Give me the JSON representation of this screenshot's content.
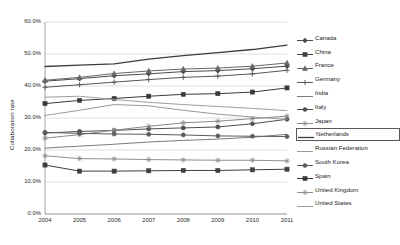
{
  "chart_data": {
    "type": "line",
    "title": "",
    "xlabel": "",
    "ylabel": "Collaboration rate",
    "categories": [
      "2004",
      "2005",
      "2006",
      "2007",
      "2008",
      "2009",
      "2010",
      "2011"
    ],
    "x": [
      2004,
      2005,
      2006,
      2007,
      2008,
      2009,
      2010,
      2011
    ],
    "ylim": [
      0,
      60
    ],
    "ytick_labels": [
      "0.0%",
      "10.0%",
      "20.0%",
      "30.0%",
      "40.0%",
      "50.0%",
      "60.0%"
    ],
    "ytick_values": [
      0,
      10,
      20,
      30,
      40,
      50,
      60
    ],
    "grid": true,
    "grid_axis": "y",
    "legend_position": "right",
    "highlighted_series": "Netherlands",
    "series": [
      {
        "name": "Canada",
        "marker": "diamond",
        "color": "#4a4a4a",
        "values": [
          41.5,
          42.3,
          43.2,
          43.8,
          44.5,
          44.8,
          45.4,
          46.2
        ]
      },
      {
        "name": "China",
        "marker": "square",
        "color": "#3f3f3f",
        "values": [
          15.3,
          13.4,
          13.4,
          13.5,
          13.6,
          13.6,
          13.8,
          14.0
        ]
      },
      {
        "name": "France",
        "marker": "triangle",
        "color": "#666666",
        "values": [
          41.8,
          42.7,
          43.9,
          44.7,
          45.3,
          45.6,
          46.2,
          47.2
        ]
      },
      {
        "name": "Germany",
        "marker": "cross",
        "color": "#555555",
        "values": [
          39.6,
          40.4,
          41.2,
          42.0,
          42.7,
          43.1,
          43.8,
          44.9
        ]
      },
      {
        "name": "India",
        "marker": "none",
        "color": "#7a7a7a",
        "values": [
          20.6,
          21.2,
          21.8,
          22.5,
          23.0,
          23.4,
          24.0,
          24.9
        ]
      },
      {
        "name": "Italy",
        "marker": "circle",
        "color": "#4f4f4f",
        "values": [
          25.3,
          25.8,
          26.1,
          26.6,
          26.9,
          27.2,
          28.2,
          29.6
        ]
      },
      {
        "name": "Japan",
        "marker": "asterisk",
        "color": "#8a8a8a",
        "values": [
          23.7,
          24.8,
          26.2,
          27.4,
          28.5,
          29.0,
          29.8,
          30.6
        ]
      },
      {
        "name": "Netherlands",
        "marker": "none",
        "color": "#3c3c3c",
        "values": [
          46.1,
          46.5,
          46.9,
          48.4,
          49.5,
          50.4,
          51.4,
          52.8
        ]
      },
      {
        "name": "Russian Federation",
        "marker": "none",
        "color": "#9a9a9a",
        "values": [
          30.8,
          32.4,
          34.2,
          33.8,
          32.4,
          31.2,
          30.3,
          29.6
        ]
      },
      {
        "name": "South Korea",
        "marker": "circle",
        "color": "#5c5c5c",
        "values": [
          25.5,
          25.2,
          25.0,
          24.9,
          24.7,
          24.4,
          24.3,
          24.2
        ]
      },
      {
        "name": "Spain",
        "marker": "square",
        "color": "#3a3a3a",
        "values": [
          34.5,
          35.5,
          36.1,
          36.8,
          37.4,
          37.6,
          38.1,
          39.4
        ]
      },
      {
        "name": "United Kingdom",
        "marker": "asterisk",
        "color": "#8f8f8f",
        "values": [
          18.2,
          17.3,
          17.2,
          17.0,
          16.9,
          16.8,
          16.8,
          16.6
        ]
      },
      {
        "name": "United States",
        "marker": "none",
        "color": "#9e9e9e",
        "values": [
          36.5,
          36.8,
          35.8,
          34.9,
          34.2,
          33.6,
          33.0,
          32.3
        ]
      }
    ]
  },
  "legend": {
    "items": [
      {
        "label": "Canada"
      },
      {
        "label": "China"
      },
      {
        "label": "France"
      },
      {
        "label": "Germany"
      },
      {
        "label": "India"
      },
      {
        "label": "Italy"
      },
      {
        "label": "Japan"
      },
      {
        "label": "Netherlands"
      },
      {
        "label": "Russian Federation"
      },
      {
        "label": "South Korea"
      },
      {
        "label": "Spain"
      },
      {
        "label": "United Kingdom"
      },
      {
        "label": "United States"
      }
    ]
  },
  "axes": {
    "y_title": "Collaboration rate"
  }
}
